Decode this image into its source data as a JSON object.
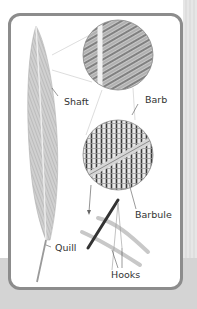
{
  "figure": {
    "labels": {
      "shaft": "Shaft",
      "barb": "Barb",
      "barbule": "Barbule",
      "quill": "Quill",
      "hooks": "Hooks"
    },
    "colors": {
      "panel_border": "#8c8c8c",
      "background": "#d9d9d9",
      "feather": "#bdbdbd",
      "text": "#333333"
    }
  }
}
